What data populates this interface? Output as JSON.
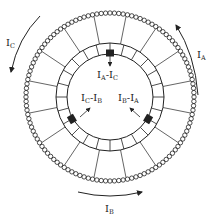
{
  "diagram": {
    "colors": {
      "ink": "#222222",
      "background": "#ffffff"
    },
    "geometry": {
      "center": [
        110,
        97
      ],
      "coil_ring_radius": 86,
      "coil_loop_count": 120,
      "commutator_outer_radius": 54,
      "commutator_inner_radius": 43,
      "commutator_segments": 24,
      "spoke_count": 16
    },
    "brushes": [
      {
        "position": "top",
        "angle_deg": -90,
        "label_main": "I",
        "label_sub1": "A",
        "op": "-",
        "label_main2": "I",
        "label_sub2": "C",
        "text": "IA - IC"
      },
      {
        "position": "lower-left",
        "angle_deg": 150,
        "label_main": "I",
        "label_sub1": "C",
        "op": "-",
        "label_main2": "I",
        "label_sub2": "B",
        "text": "IC - IB"
      },
      {
        "position": "lower-right",
        "angle_deg": 30,
        "label_main": "I",
        "label_sub1": "B",
        "op": "-",
        "label_main2": "I",
        "label_sub2": "A",
        "text": "IB - IA"
      }
    ],
    "currents": [
      {
        "name": "IC",
        "main": "I",
        "sub": "C",
        "position": "upper-left",
        "direction": "counter-clockwise (downward)"
      },
      {
        "name": "IA",
        "main": "I",
        "sub": "A",
        "position": "upper-right",
        "direction": "counter-clockwise (upward)"
      },
      {
        "name": "IB",
        "main": "I",
        "sub": "B",
        "position": "bottom",
        "direction": "left-to-right"
      }
    ]
  }
}
